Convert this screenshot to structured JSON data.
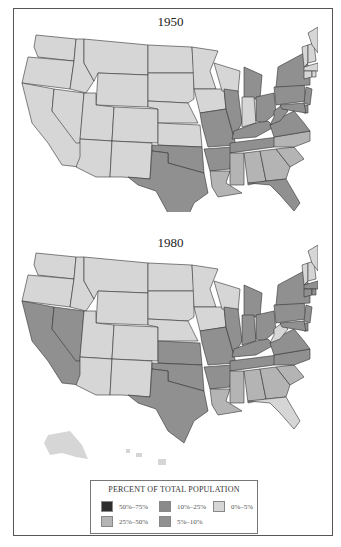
{
  "maps": [
    {
      "year": "1950",
      "states": {
        "WA": "0-5",
        "OR": "0-5",
        "CA": "0-5",
        "NV": "0-5",
        "ID": "0-5",
        "MT": "0-5",
        "WY": "0-5",
        "UT": "0-5",
        "AZ": "0-5",
        "CO": "0-5",
        "NM": "0-5",
        "ND": "0-5",
        "SD": "0-5",
        "NE": "0-5",
        "KS": "0-5",
        "MN": "0-5",
        "IA": "0-5",
        "WI": "0-5",
        "IN": "0-5",
        "ME": "0-5",
        "VT": "0-5",
        "NH": "0-5",
        "MA": "0-5",
        "RI": "0-5",
        "CT": "0-5",
        "OK": "5-10",
        "TX": "5-10",
        "MO": "5-10",
        "AR": "5-10",
        "IL": "5-10",
        "MI": "5-10",
        "OH": "5-10",
        "KY": "5-10",
        "TN": "5-10",
        "WV": "5-10",
        "VA": "5-10",
        "NY": "5-10",
        "PA": "5-10",
        "NJ": "5-10",
        "MD": "5-10",
        "DE": "5-10",
        "FL": "5-10",
        "LA": "25-50",
        "MS": "25-50",
        "AL": "25-50",
        "GA": "25-50",
        "SC": "25-50",
        "NC": "25-50"
      }
    },
    {
      "year": "1980",
      "states": {
        "WA": "0-5",
        "OR": "0-5",
        "ID": "0-5",
        "MT": "0-5",
        "WY": "0-5",
        "UT": "0-5",
        "AZ": "0-5",
        "CO": "0-5",
        "NM": "0-5",
        "ND": "0-5",
        "SD": "0-5",
        "NE": "0-5",
        "MN": "0-5",
        "IA": "0-5",
        "WI": "0-5",
        "ME": "0-5",
        "VT": "0-5",
        "NH": "0-5",
        "WV": "0-5",
        "FL": "0-5",
        "AK": "0-5",
        "HI": "0-5",
        "CA": "5-10",
        "NV": "5-10",
        "KS": "5-10",
        "OK": "5-10",
        "TX": "5-10",
        "MO": "5-10",
        "AR": "5-10",
        "IL": "5-10",
        "IN": "5-10",
        "MI": "5-10",
        "OH": "5-10",
        "KY": "5-10",
        "TN": "5-10",
        "VA": "5-10",
        "NC": "5-10",
        "NY": "5-10",
        "PA": "5-10",
        "NJ": "5-10",
        "MD": "5-10",
        "DE": "5-10",
        "MA": "5-10",
        "RI": "5-10",
        "CT": "5-10",
        "LA": "25-50",
        "MS": "25-50",
        "AL": "25-50",
        "GA": "25-50",
        "SC": "25-50"
      }
    }
  ],
  "legend": {
    "title": "PERCENT OF TOTAL POPULATION",
    "items": [
      {
        "key": "50-75",
        "label": "50%–75%",
        "color": "#2e2e2e"
      },
      {
        "key": "25-50",
        "label": "25%–50%",
        "color": "#b4b4b4"
      },
      {
        "key": "10-25",
        "label": "10%–25%",
        "color": "#8a8a8a"
      },
      {
        "key": "5-10",
        "label": "5%–10%",
        "color": "#909090"
      },
      {
        "key": "0-5",
        "label": "0%–5%",
        "color": "#d6d6d6"
      }
    ]
  }
}
